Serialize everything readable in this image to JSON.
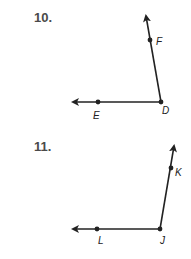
{
  "problems": [
    {
      "number": "10.",
      "vertex": {
        "label": "D",
        "x": 161,
        "y": 102
      },
      "ray1": {
        "point_label": "F",
        "point": [
          150,
          40
        ],
        "tip": [
          145,
          12
        ]
      },
      "ray2": {
        "point_label": "E",
        "point": [
          98,
          102
        ],
        "tip": [
          70,
          102
        ]
      }
    },
    {
      "number": "11.",
      "vertex": {
        "label": "J",
        "x": 160,
        "y": 229
      },
      "ray1": {
        "point_label": "K",
        "point": [
          171,
          168
        ],
        "tip": [
          175,
          142
        ]
      },
      "ray2": {
        "point_label": "L",
        "point": [
          97,
          229
        ],
        "tip": [
          70,
          229
        ]
      }
    }
  ],
  "colors": {
    "line": "#222222",
    "number": "#4a4a4a"
  }
}
